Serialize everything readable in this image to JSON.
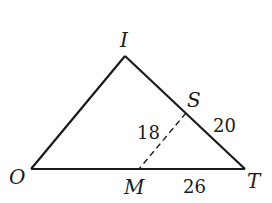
{
  "diagram": {
    "type": "geometry-triangle",
    "vertices": {
      "I": {
        "label": "I",
        "x": 125,
        "y": 56
      },
      "O": {
        "label": "O",
        "x": 31,
        "y": 169
      },
      "T": {
        "label": "T",
        "x": 245,
        "y": 169
      }
    },
    "points": {
      "S": {
        "label": "S",
        "x": 186,
        "y": 113,
        "on": "IT"
      },
      "M": {
        "label": "M",
        "x": 139,
        "y": 169,
        "on": "OT"
      }
    },
    "segments": [
      {
        "from": "O",
        "to": "I",
        "style": "solid"
      },
      {
        "from": "I",
        "to": "T",
        "style": "solid"
      },
      {
        "from": "O",
        "to": "T",
        "style": "solid"
      },
      {
        "from": "S",
        "to": "M",
        "style": "dashed"
      }
    ],
    "measures": {
      "SM": "18",
      "ST": "20",
      "MT": "26"
    },
    "colors": {
      "stroke": "#1a1a1a",
      "background": "#ffffff"
    }
  }
}
